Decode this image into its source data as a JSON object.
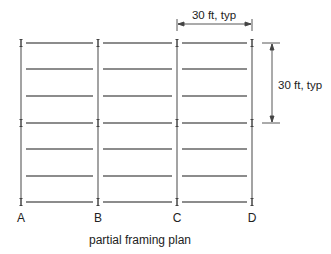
{
  "diagram": {
    "title": "partial framing plan",
    "columns": [
      {
        "label": "A",
        "x": 21
      },
      {
        "label": "B",
        "x": 98
      },
      {
        "label": "C",
        "x": 177
      },
      {
        "label": "D",
        "x": 252
      }
    ],
    "rows_y": [
      43,
      69,
      96,
      123,
      149,
      176,
      202
    ],
    "girder_rows_y": [
      43,
      123,
      202
    ],
    "dimensions": {
      "horizontal": {
        "label": "30 ft, typ",
        "from": "C",
        "to": "D"
      },
      "vertical": {
        "label": "30 ft, typ"
      }
    },
    "colors": {
      "line": "#555555",
      "text": "#222222"
    }
  }
}
